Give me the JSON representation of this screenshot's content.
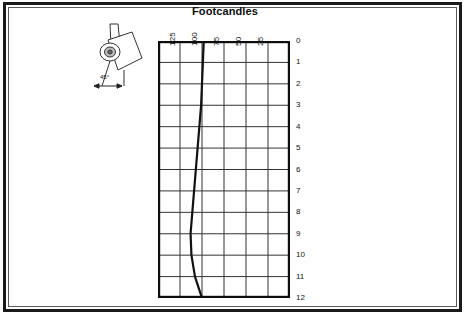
{
  "page": {
    "background_color": "#ffffff",
    "frame_color": "#1a1a1a"
  },
  "figure": {
    "title": "Footcandles",
    "luminaire": {
      "icon": "tilted-luminaire-icon",
      "angle_label": "45°"
    }
  },
  "chart_data": {
    "type": "line",
    "title": "Footcandles",
    "xlabel": "",
    "ylabel": "",
    "x_tick_labels": [
      "125",
      "100",
      "75",
      "50",
      "25"
    ],
    "x_tick_values": [
      125,
      100,
      75,
      50,
      25
    ],
    "xlim": [
      150,
      0
    ],
    "y_tick_labels": [
      "0",
      "1",
      "2",
      "3",
      "4",
      "5",
      "6",
      "7",
      "8",
      "9",
      "10",
      "11",
      "12"
    ],
    "y_tick_values": [
      0,
      1,
      2,
      3,
      4,
      5,
      6,
      7,
      8,
      9,
      10,
      11,
      12
    ],
    "ylim": [
      0,
      12
    ],
    "grid": true,
    "grid_columns": 6,
    "grid_rows": 12,
    "legend": "none",
    "series": [
      {
        "name": "Footcandle distribution",
        "color": "#111111",
        "x": [
          98,
          99,
          100,
          101,
          103,
          105,
          107,
          109,
          111,
          113,
          112,
          108,
          100
        ],
        "y": [
          0,
          1,
          2,
          3,
          4,
          5,
          6,
          7,
          8,
          9,
          10,
          11,
          12
        ]
      }
    ]
  }
}
